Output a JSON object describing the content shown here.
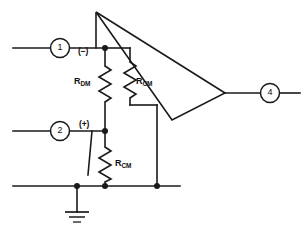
{
  "diagram": {
    "type": "schematic",
    "background_color": "#ffffff",
    "line_color": "#1a1a1a"
  },
  "amplifier": {
    "name": "op-amp",
    "shape": "triangle",
    "inverting_label": "(−)",
    "noninverting_label": "(+)"
  },
  "pins": [
    {
      "id": "pin-1",
      "number": "1",
      "role": "inverting-input",
      "side": "left"
    },
    {
      "id": "pin-2",
      "number": "2",
      "role": "noninverting-input",
      "side": "left"
    },
    {
      "id": "pin-4",
      "number": "4",
      "role": "output",
      "side": "right"
    }
  ],
  "components": [
    {
      "id": "r-dm",
      "type": "resistor",
      "label_main": "R",
      "label_sub": "DM",
      "description": "differential-mode input resistance"
    },
    {
      "id": "r-cm-upper",
      "type": "resistor",
      "label_main": "R",
      "label_sub": "CM",
      "description": "common-mode input resistance, inverting side"
    },
    {
      "id": "r-cm-lower",
      "type": "resistor",
      "label_main": "R",
      "label_sub": "CM",
      "description": "common-mode input resistance, noninverting side"
    }
  ],
  "ground": {
    "id": "ground-symbol",
    "type": "earth-ground"
  }
}
